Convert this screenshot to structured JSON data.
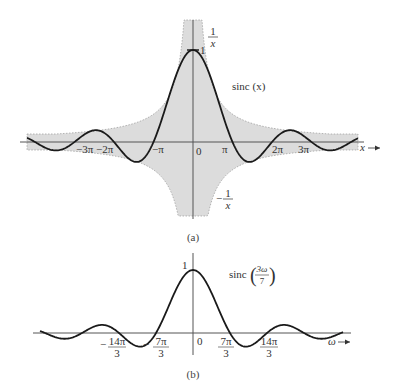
{
  "chart_data": [
    {
      "type": "line",
      "panel_label": "(a)",
      "title": "",
      "curve_label": "sinc (x)",
      "xlabel": "x",
      "ylabel": "",
      "x_ticks": [
        "-3π",
        "-2π",
        "-π",
        "0",
        "π",
        "2π",
        "3π"
      ],
      "x_tick_values": [
        -9.4248,
        -6.2832,
        -3.1416,
        0,
        3.1416,
        6.2832,
        9.4248
      ],
      "y_ticks": [
        "1"
      ],
      "xlim": [
        -4.2,
        4.2
      ],
      "xlim_units": "multiples of π",
      "ylim": [
        -1.2,
        1.3
      ],
      "grid": false,
      "envelope": {
        "upper_label": "1/x",
        "lower_label": "-1/x",
        "style": "dotted, gray shaded"
      },
      "series": [
        {
          "name": "sinc(x) = sin(x)/x",
          "x": [
            -12.566,
            -9.4248,
            -7.725,
            -6.2832,
            -4.493,
            -3.1416,
            0,
            3.1416,
            4.493,
            6.2832,
            7.725,
            9.4248,
            12.566
          ],
          "y": [
            0,
            0,
            0.128,
            0,
            -0.217,
            0,
            1,
            0,
            -0.217,
            0,
            0.128,
            0,
            0
          ]
        },
        {
          "name": "1/x",
          "envelope": true
        },
        {
          "name": "-1/x",
          "envelope": true
        }
      ]
    },
    {
      "type": "line",
      "panel_label": "(b)",
      "curve_label": "sinc(3ω/7)",
      "xlabel": "ω",
      "ylabel": "",
      "x_ticks": [
        "-14π/3",
        "-7π/3",
        "0",
        "7π/3",
        "14π/3"
      ],
      "x_tick_values": [
        -14.661,
        -7.33,
        0,
        7.33,
        14.661
      ],
      "y_ticks": [
        "1"
      ],
      "grid": false,
      "series": [
        {
          "name": "sinc(3ω/7)",
          "x": [
            -21.99,
            -14.661,
            -10.48,
            -7.33,
            0,
            7.33,
            10.48,
            14.661,
            18.03,
            21.99
          ],
          "y": [
            0,
            0,
            -0.217,
            0,
            1,
            0,
            -0.217,
            0,
            0.128,
            0
          ]
        }
      ]
    }
  ],
  "labels": {
    "a": {
      "caption": "(a)",
      "curve": "sinc (x)",
      "one": "1",
      "zero": "0",
      "axis_x": "x",
      "env_upper_num": "1",
      "env_upper_den": "x",
      "env_lower_sign": "−",
      "env_lower_num": "1",
      "env_lower_den": "x",
      "ticks": [
        "−3π",
        "−2π",
        "−π",
        "π",
        "2π",
        "3π"
      ]
    },
    "b": {
      "caption": "(b)",
      "curve_prefix": "sinc",
      "curve_num": "3ω",
      "curve_den": "7",
      "one": "1",
      "zero": "0",
      "axis_x": "ω",
      "ticks": [
        {
          "sign": "−",
          "num": "14π",
          "den": "3"
        },
        {
          "sign": "−",
          "num": "7π",
          "den": "3"
        },
        {
          "sign": "",
          "num": "7π",
          "den": "3"
        },
        {
          "sign": "",
          "num": "14π",
          "den": "3"
        }
      ]
    }
  },
  "colors": {
    "curve": "#1a1a1a",
    "axis": "#555555",
    "envelope_fill": "#d9d9d9",
    "envelope_stroke": "#9a9a9a"
  }
}
